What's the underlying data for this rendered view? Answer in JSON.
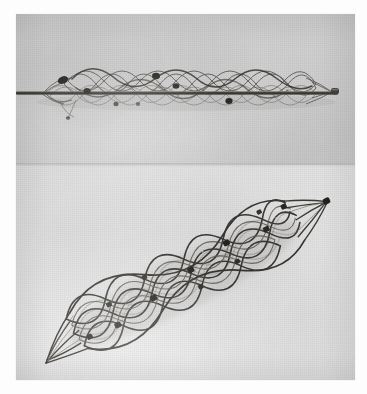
{
  "image": {
    "kind": "photograph",
    "subject": "braided-mesh-stent",
    "rendering": "grayscale",
    "caption_text": "",
    "visible_text": "",
    "width_px": 367,
    "height_px": 394
  },
  "plate": {
    "background_color": "#fdfdfd",
    "border_color": "#dcdcdc",
    "left_px": 16,
    "top_px": 14,
    "width_px": 339,
    "height_px": 366
  },
  "panels": [
    {
      "id": "panel-top",
      "label": "crimped-stent-on-delivery-catheter",
      "background_color": "#d4d4d4",
      "top_px": 0,
      "height_px": 151,
      "orientation": "horizontal",
      "device_state": "crimped"
    },
    {
      "id": "panel-bottom",
      "label": "expanded-stent",
      "background_color": "#e7e7e7",
      "top_px": 151,
      "height_px": 215,
      "orientation": "diagonal",
      "device_state": "expanded"
    }
  ],
  "device": {
    "name": "braided-mesh-stent",
    "wire_color": "#4a4741",
    "wire_color_light": "#7d7a73",
    "marker_color": "#2c2a26",
    "catheter_color": "#3a3833",
    "marker_count_crimped": 6,
    "marker_count_expanded": 12,
    "cell_shape": "diamond"
  },
  "colors": {
    "paper_white": "#fdfdfd",
    "panel_top_gray": "#d4d4d4",
    "panel_bottom_gray": "#e7e7e7",
    "wire_dark": "#4a4741",
    "marker_dark": "#2c2a26"
  }
}
